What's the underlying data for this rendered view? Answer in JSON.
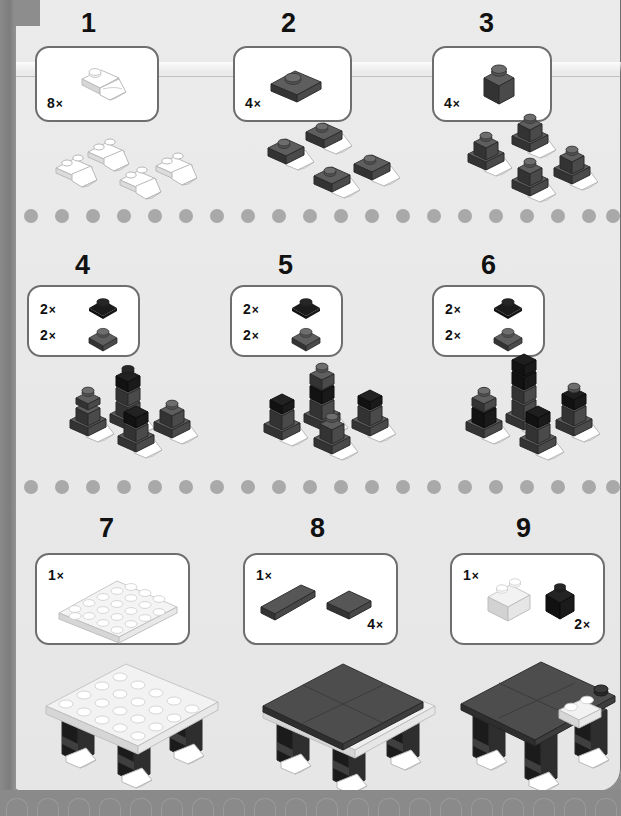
{
  "page": {
    "background_color": "#e9e9e9",
    "frame_color": "#8a8a8a",
    "box_border_color": "#6e6e6e",
    "separator_dot_color": "#a9a9a9"
  },
  "palette": {
    "white_top": "#ffffff",
    "white_left": "#d9d9d9",
    "white_right": "#ededed",
    "gray_top": "#6a6a6a",
    "gray_left": "#3f3f3f",
    "gray_right": "#565656",
    "black_top": "#2b2b2b",
    "black_left": "#141414",
    "black_right": "#1e1e1e"
  },
  "steps": [
    {
      "number": "1",
      "parts": [
        {
          "qty": "8",
          "x_mark": "×",
          "name": "claw-plate-white",
          "color": "white"
        }
      ],
      "assembly": {
        "name": "four-white-claw-plates",
        "count": 4
      }
    },
    {
      "number": "2",
      "parts": [
        {
          "qty": "4",
          "x_mark": "×",
          "name": "plate-1x2-dark-gray",
          "color": "gray"
        }
      ],
      "assembly": {
        "name": "four-claw-feet-with-dark-plate",
        "count": 4
      }
    },
    {
      "number": "3",
      "parts": [
        {
          "qty": "4",
          "x_mark": "×",
          "name": "brick-1x1-dark-gray",
          "color": "gray"
        }
      ],
      "assembly": {
        "name": "four-legs-one-brick-tall",
        "count": 4
      }
    },
    {
      "number": "4",
      "parts": [
        {
          "qty": "2",
          "x_mark": "×",
          "name": "plate-1x1-black",
          "color": "black"
        },
        {
          "qty": "2",
          "x_mark": "×",
          "name": "plate-1x1-dark-gray",
          "color": "gray"
        }
      ],
      "assembly": {
        "name": "four-legs-growing-taller",
        "count": 4
      }
    },
    {
      "number": "5",
      "parts": [
        {
          "qty": "2",
          "x_mark": "×",
          "name": "plate-1x1-black",
          "color": "black"
        },
        {
          "qty": "2",
          "x_mark": "×",
          "name": "plate-1x1-dark-gray",
          "color": "gray"
        }
      ],
      "assembly": {
        "name": "four-legs-growing-taller",
        "count": 4
      }
    },
    {
      "number": "6",
      "parts": [
        {
          "qty": "2",
          "x_mark": "×",
          "name": "plate-1x1-black",
          "color": "black"
        },
        {
          "qty": "2",
          "x_mark": "×",
          "name": "plate-1x1-dark-gray",
          "color": "gray"
        }
      ],
      "assembly": {
        "name": "four-legs-growing-taller",
        "count": 4
      }
    },
    {
      "number": "7",
      "parts": [
        {
          "qty": "1",
          "x_mark": "×",
          "name": "plate-4x6-white",
          "color": "white"
        }
      ],
      "assembly": {
        "name": "legs-with-white-plate-top",
        "count": 1
      }
    },
    {
      "number": "8",
      "parts": [
        {
          "qty": "1",
          "x_mark": "×",
          "name": "tile-1x4-dark-gray",
          "color": "gray"
        },
        {
          "qty": "4",
          "x_mark": "×",
          "name": "tile-2x2-dark-gray",
          "color": "gray"
        }
      ],
      "assembly": {
        "name": "body-with-dark-tiled-top",
        "count": 1
      }
    },
    {
      "number": "9",
      "parts": [
        {
          "qty": "1",
          "x_mark": "×",
          "name": "brick-1x2-white",
          "color": "white"
        },
        {
          "qty": "2",
          "x_mark": "×",
          "name": "brick-1x1-black",
          "color": "black"
        }
      ],
      "assembly": {
        "name": "body-with-head-detail",
        "count": 1
      }
    }
  ],
  "separators": [
    {
      "name": "separator-row-1",
      "dot_count": 20
    },
    {
      "name": "separator-row-2",
      "dot_count": 20
    }
  ]
}
